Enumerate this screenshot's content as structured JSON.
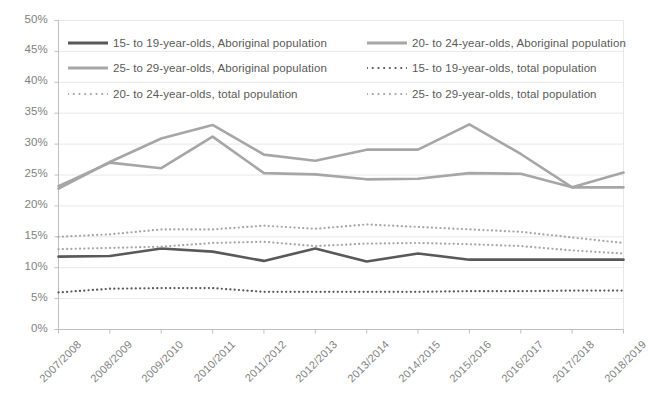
{
  "chart_data": {
    "type": "line",
    "title": "",
    "subtitle": "",
    "xlabel": "",
    "ylabel": "",
    "ylim": [
      0,
      50
    ],
    "y_ticks": [
      "0%",
      "5%",
      "10%",
      "15%",
      "20%",
      "25%",
      "30%",
      "35%",
      "40%",
      "45%",
      "50%"
    ],
    "y_tick_values": [
      0,
      5,
      10,
      15,
      20,
      25,
      30,
      35,
      40,
      45,
      50
    ],
    "grid": true,
    "legend_position": "top-inside",
    "categories": [
      "2007/2008",
      "2008/2009",
      "2009/2010",
      "2010/2011",
      "2011/2012",
      "2012/2013",
      "2013/2014",
      "2014/2015",
      "2015/2016",
      "2016/2017",
      "2017/2018",
      "2018/2019"
    ],
    "series": [
      {
        "name": "15- to 19-year-olds, Aboriginal population",
        "style": "solid",
        "color": "#595959",
        "width": 2.6,
        "values": [
          11.8,
          11.9,
          13.1,
          12.6,
          11.1,
          13.1,
          11.0,
          12.3,
          11.3,
          11.3,
          11.3,
          11.3
        ]
      },
      {
        "name": "20- to 24-year-olds, Aboriginal population",
        "style": "solid",
        "color": "#a6a6a6",
        "width": 2.6,
        "values": [
          23.2,
          27.0,
          26.1,
          31.2,
          25.3,
          25.1,
          24.3,
          24.4,
          25.3,
          25.2,
          23.0,
          23.0
        ]
      },
      {
        "name": "25- to 29-year-olds, Aboriginal population",
        "style": "solid",
        "color": "#a6a6a6",
        "width": 2.6,
        "values": [
          22.8,
          27.1,
          30.9,
          33.1,
          28.3,
          27.3,
          29.1,
          29.1,
          33.2,
          28.4,
          23.0,
          25.4
        ]
      },
      {
        "name": "15- to 19-year-olds, total population",
        "style": "dotted",
        "color": "#595959",
        "width": 2.2,
        "values": [
          6.0,
          6.6,
          6.7,
          6.7,
          6.1,
          6.1,
          6.1,
          6.1,
          6.2,
          6.2,
          6.3,
          6.3
        ]
      },
      {
        "name": "20- to 24-year-olds, total population",
        "style": "dotted",
        "color": "#a6a6a6",
        "width": 2.2,
        "values": [
          13.0,
          13.2,
          13.4,
          14.0,
          14.2,
          13.5,
          13.9,
          14.0,
          13.8,
          13.5,
          12.8,
          12.3
        ]
      },
      {
        "name": "25- to 29-year-olds, total population",
        "style": "dotted",
        "color": "#a6a6a6",
        "width": 2.2,
        "values": [
          15.0,
          15.4,
          16.2,
          16.2,
          16.8,
          16.3,
          17.0,
          16.6,
          16.2,
          15.8,
          14.9,
          14.0
        ]
      }
    ]
  },
  "legend": {
    "entries": [
      {
        "label": "15- to 19-year-olds, Aboriginal population",
        "style": "solid",
        "color": "#595959"
      },
      {
        "label": "20- to 24-year-olds, Aboriginal population",
        "style": "solid",
        "color": "#a6a6a6"
      },
      {
        "label": "25- to 29-year-olds, Aboriginal population",
        "style": "solid",
        "color": "#a6a6a6"
      },
      {
        "label": "15- to 19-year-olds, total population",
        "style": "dotted",
        "color": "#595959"
      },
      {
        "label": "20- to 24-year-olds, total population",
        "style": "dotted",
        "color": "#a6a6a6"
      },
      {
        "label": "25- to 29-year-olds, total population",
        "style": "dotted",
        "color": "#a6a6a6"
      }
    ]
  },
  "colors": {
    "dark_series": "#595959",
    "light_series": "#a6a6a6",
    "gridline": "#e8e8e8",
    "axis": "#bfbfbf",
    "tick_text": "#7f7f7f"
  }
}
